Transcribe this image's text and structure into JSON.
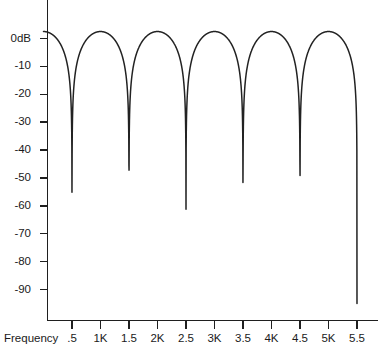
{
  "chart_data": {
    "type": "line",
    "title": "",
    "xlabel": "Frequency",
    "ylabel": "",
    "xtick_labels": [
      ".5",
      "1K",
      "1.5",
      "2K",
      "2.5",
      "3K",
      "3.5",
      "4K",
      "4.5",
      "5K",
      "5.5"
    ],
    "xtick_values": [
      500,
      1000,
      1500,
      2000,
      2500,
      3000,
      3500,
      4000,
      4500,
      5000,
      5500
    ],
    "ytick_labels": [
      "0dB",
      "-10",
      "-20",
      "-30",
      "-40",
      "-50",
      "-60",
      "-70",
      "-80",
      "-90"
    ],
    "ytick_values": [
      0,
      -10,
      -20,
      -30,
      -40,
      -50,
      -60,
      -70,
      -80,
      -90
    ],
    "xlim": [
      0,
      5750
    ],
    "ylim": [
      -95,
      5
    ],
    "grid": false,
    "legend": null,
    "line_color": "#222222",
    "axis_color": "#1f1f1f",
    "background": "#ffffff",
    "peak_frequencies": [
      0,
      1000,
      2000,
      3000,
      4000,
      5000
    ],
    "peak_values": [
      2.5,
      2.5,
      2.5,
      2.5,
      2.5,
      2.5
    ],
    "null_frequencies": [
      500,
      1500,
      2500,
      3500,
      4500,
      5500
    ],
    "null_values": [
      -95,
      -95,
      -95,
      -95,
      -95,
      -95
    ],
    "series": [
      {
        "name": "magnitude",
        "x": [
          0,
          1000,
          2000,
          3000,
          4000,
          5000,
          5500
        ],
        "values": [
          2.5,
          2.5,
          2.5,
          2.5,
          2.5,
          2.5,
          -95
        ]
      }
    ]
  }
}
